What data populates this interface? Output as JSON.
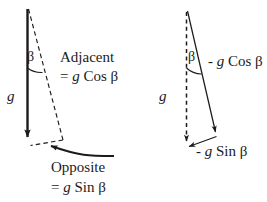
{
  "figure": {
    "background_color": "#ffffff",
    "stroke_color": "#1b1b1b",
    "width": 267,
    "height": 202
  },
  "left_diagram": {
    "name": "adjacent-opposite-triangle",
    "gravity_label": "g",
    "angle_label": "β",
    "adjacent_label": "Adjacent",
    "adjacent_value": "= g Cos β",
    "adjacent_value_prefix": "=",
    "adjacent_value_symbol": "g",
    "adjacent_value_function": "Cos",
    "adjacent_value_angle": "β",
    "opposite_label": "Opposite",
    "opposite_value": "= g Sin β",
    "opposite_value_prefix": "=",
    "opposite_value_symbol": "g",
    "opposite_value_function": "Sin",
    "opposite_value_angle": "β"
  },
  "right_diagram": {
    "name": "negative-component-triangle",
    "gravity_label": "g",
    "angle_label": "β",
    "cos_component_label": "- g Cos β",
    "cos_sign": "-",
    "cos_symbol": "g",
    "cos_function": "Cos",
    "cos_angle": "β",
    "sin_component_label": "- g Sin β",
    "sin_sign": "-",
    "sin_symbol": "g",
    "sin_function": "Sin",
    "sin_angle": "β"
  }
}
